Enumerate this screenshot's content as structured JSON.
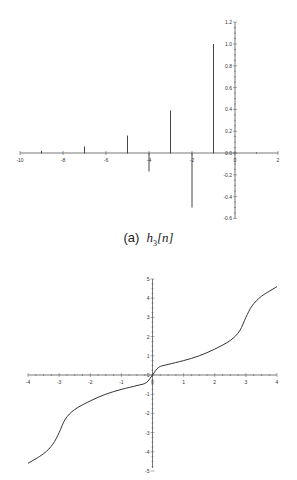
{
  "chart_data": [
    {
      "type": "stem",
      "title": "",
      "caption": "(a)  h3[n]",
      "caption_label": "(a)",
      "caption_symbol": "h",
      "caption_subscript": "3",
      "caption_arg": "[n]",
      "xlabel": "",
      "ylabel": "",
      "xlim": [
        -10,
        2
      ],
      "ylim": [
        -0.6,
        1.2
      ],
      "x_ticks": [
        -10,
        -8,
        -6,
        -4,
        -2,
        0,
        2
      ],
      "y_ticks": [
        -0.6,
        -0.4,
        -0.2,
        0.0,
        0.2,
        0.4,
        0.6,
        0.8,
        1.0,
        1.2
      ],
      "x_tick_labels": [
        "-10",
        "-8",
        "-6",
        "-4",
        "-2",
        "0",
        "2"
      ],
      "y_tick_labels": [
        "-0.6",
        "-0.4",
        "-0.2",
        "0.0",
        "0.2",
        "0.4",
        "0.6",
        "0.8",
        "1.0",
        "1.2"
      ],
      "grid": false,
      "x": [
        -9,
        -7,
        -5,
        -4,
        -3,
        -2,
        -1
      ],
      "values": [
        0.02,
        0.06,
        0.16,
        -0.17,
        0.39,
        -0.5,
        1.0
      ]
    },
    {
      "type": "line",
      "title": "",
      "xlabel": "",
      "ylabel": "",
      "xlim": [
        -4,
        4
      ],
      "ylim": [
        -5,
        5
      ],
      "x_ticks": [
        -4,
        -3,
        -2,
        -1,
        0,
        1,
        2,
        3,
        4
      ],
      "y_ticks": [
        -5,
        -4,
        -3,
        -2,
        -1,
        0,
        1,
        2,
        3,
        4,
        5
      ],
      "x_tick_labels": [
        "-4",
        "-3",
        "-2",
        "-1",
        "0",
        "1",
        "2",
        "3",
        "4"
      ],
      "y_tick_labels": [
        "-5",
        "-4",
        "-3",
        "-2",
        "-1",
        "0",
        "1",
        "2",
        "3",
        "4",
        "5"
      ],
      "grid": false,
      "series": [
        {
          "name": "curve",
          "x": [
            -4,
            -3.5,
            -3.2,
            -3,
            -2.8,
            -2.5,
            -2,
            -1.5,
            -1,
            -0.5,
            -0.2,
            0,
            0.2,
            0.5,
            1,
            1.5,
            2,
            2.5,
            2.8,
            3,
            3.2,
            3.5,
            4
          ],
          "values": [
            -4.6,
            -4.1,
            -3.6,
            -3.0,
            -2.3,
            -1.8,
            -1.35,
            -1.0,
            -0.75,
            -0.55,
            -0.4,
            0,
            0.4,
            0.55,
            0.75,
            1.0,
            1.35,
            1.8,
            2.3,
            3.0,
            3.6,
            4.1,
            4.6
          ]
        }
      ]
    }
  ],
  "colors": {
    "axis": "#555555",
    "stem": "#444444",
    "curve": "#333333",
    "background": "#ffffff"
  }
}
